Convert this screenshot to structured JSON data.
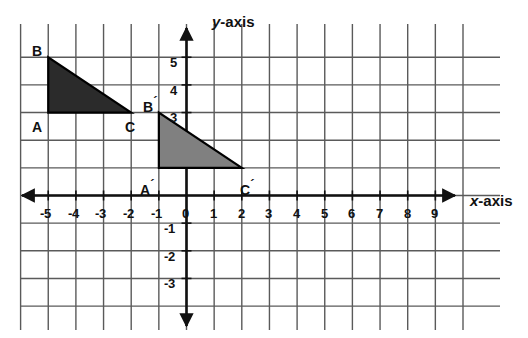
{
  "chart_data": {
    "type": "scatter",
    "title": "",
    "xlabel": "x-axis",
    "ylabel": "y-axis",
    "xlim": [
      -5.9,
      9.9
    ],
    "ylim": [
      -3.9,
      5.7
    ],
    "grid": true,
    "x_ticks": [
      "-5",
      "-4",
      "-3",
      "-2",
      "-1",
      "0",
      "1",
      "2",
      "3",
      "4",
      "5",
      "6",
      "7",
      "8",
      "9"
    ],
    "x_tick_values": [
      -5,
      -4,
      -3,
      -2,
      -1,
      0,
      1,
      2,
      3,
      4,
      5,
      6,
      7,
      8,
      9
    ],
    "y_ticks": [
      "5",
      "4",
      "3",
      "-1",
      "-2",
      "-3"
    ],
    "y_tick_values": [
      5,
      4,
      3,
      -1,
      -2,
      -3
    ],
    "shapes": [
      {
        "name": "triangle-abc",
        "fill": "#2b2b2b",
        "stroke": "#000000",
        "vertices": [
          {
            "label": "B",
            "x": -5,
            "y": 5
          },
          {
            "label": "A",
            "x": -5,
            "y": 3
          },
          {
            "label": "C",
            "x": -2,
            "y": 3
          }
        ]
      },
      {
        "name": "triangle-a-prime-b-prime-c-prime",
        "fill": "#808080",
        "stroke": "#000000",
        "vertices": [
          {
            "label": "B´",
            "x": -1,
            "y": 3
          },
          {
            "label": "A´",
            "x": -1,
            "y": 1
          },
          {
            "label": "C´",
            "x": 2,
            "y": 1
          }
        ]
      }
    ]
  },
  "axes": {
    "x_label_prefix": "x",
    "x_label_suffix": "-axis",
    "y_label_prefix": "y",
    "y_label_suffix": "-axis"
  },
  "ticks": {
    "x": [
      {
        "text": "-5",
        "left": 40,
        "top": 207
      },
      {
        "text": "-4",
        "left": 68,
        "top": 207
      },
      {
        "text": "-3",
        "left": 95,
        "top": 207
      },
      {
        "text": "-2",
        "left": 123,
        "top": 207
      },
      {
        "text": "-1",
        "left": 151,
        "top": 207
      },
      {
        "text": "0",
        "left": 182,
        "top": 207
      },
      {
        "text": "1",
        "left": 210,
        "top": 207
      },
      {
        "text": "2",
        "left": 238,
        "top": 207
      },
      {
        "text": "3",
        "left": 265,
        "top": 207
      },
      {
        "text": "4",
        "left": 293,
        "top": 207
      },
      {
        "text": "5",
        "left": 321,
        "top": 207
      },
      {
        "text": "6",
        "left": 348,
        "top": 207
      },
      {
        "text": "7",
        "left": 376,
        "top": 207
      },
      {
        "text": "8",
        "left": 404,
        "top": 207
      },
      {
        "text": "9",
        "left": 431,
        "top": 207
      }
    ],
    "y": [
      {
        "text": "5",
        "left": 170,
        "top": 56
      },
      {
        "text": "4",
        "left": 170,
        "top": 84
      },
      {
        "text": "3",
        "left": 170,
        "top": 111
      },
      {
        "text": "-1",
        "left": 164,
        "top": 222
      },
      {
        "text": "-2",
        "left": 164,
        "top": 250
      },
      {
        "text": "-3",
        "left": 164,
        "top": 277
      }
    ]
  },
  "vertex_labels": [
    {
      "name": "vertex-label-b",
      "text": "B",
      "prime": "",
      "left": 32,
      "top": 44
    },
    {
      "name": "vertex-label-a",
      "text": "A",
      "prime": "",
      "left": 32,
      "top": 120
    },
    {
      "name": "vertex-label-c",
      "text": "C",
      "prime": "",
      "left": 125,
      "top": 120
    },
    {
      "name": "vertex-label-b-prime",
      "text": "B",
      "prime": "´",
      "left": 143,
      "top": 95
    },
    {
      "name": "vertex-label-a-prime",
      "text": "A",
      "prime": "´",
      "left": 140,
      "top": 178
    },
    {
      "name": "vertex-label-c-prime",
      "text": "C",
      "prime": "´",
      "left": 240,
      "top": 178
    }
  ],
  "colors": {
    "grid": "#5a5a5a",
    "axis": "#111111",
    "shape_dark": "#2b2b2b",
    "shape_light": "#808080",
    "background": "#ffffff"
  }
}
